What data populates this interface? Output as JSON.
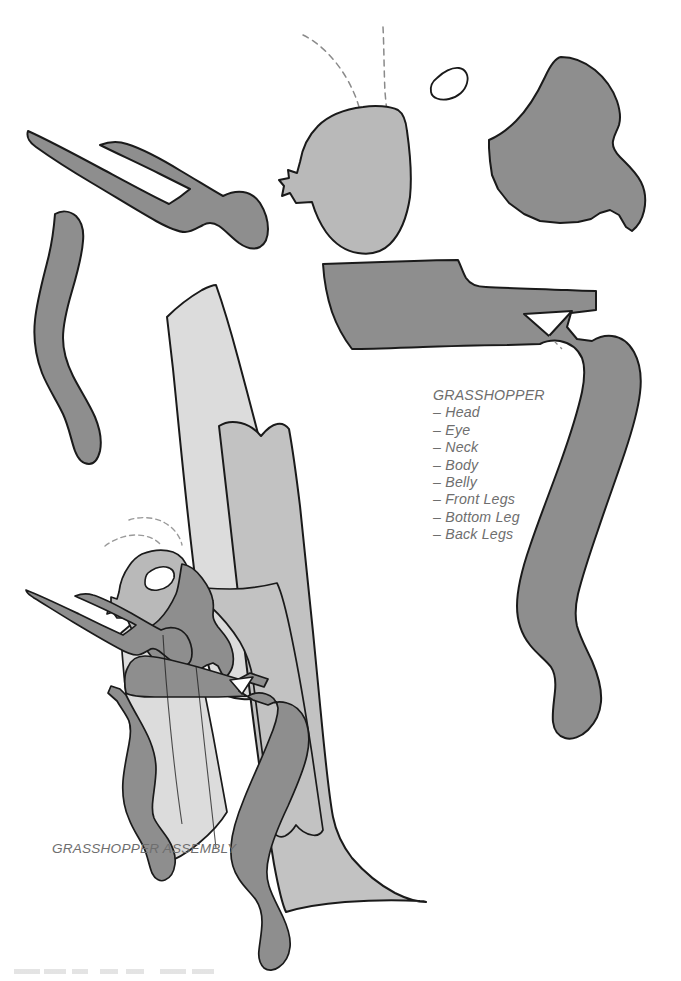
{
  "sheet": {
    "title": "Grasshopper paper cutout pattern sheet",
    "background_color": "#ffffff",
    "width": 681,
    "height": 981
  },
  "legend": {
    "title": "GRASSHOPPER",
    "items": [
      "– Head",
      "– Eye",
      "– Neck",
      "– Body",
      "– Belly",
      "– Front Legs",
      "– Bottom Leg",
      "– Back Legs"
    ]
  },
  "assembly": {
    "caption": "GRASSHOPPER ASSEMBLY"
  },
  "colors": {
    "outline": "#1a1a1a",
    "dark_gray": "#8e8e8e",
    "mid_gray": "#b9b9b9",
    "light_gray": "#dcdcdc",
    "belly_gray": "#c2c2c2",
    "eye_white": "#ffffff",
    "text_gray": "#6e6e6e",
    "dashed_gray": "#8a8a8a"
  },
  "pieces": [
    {
      "id": "head",
      "name": "Head",
      "fill": "#b9b9b9",
      "group": "cutouts"
    },
    {
      "id": "eye",
      "name": "Eye",
      "fill": "#ffffff",
      "group": "cutouts"
    },
    {
      "id": "neck",
      "name": "Neck",
      "fill": "#8e8e8e",
      "group": "cutouts"
    },
    {
      "id": "body",
      "name": "Body",
      "fill": "#dcdcdc",
      "group": "cutouts"
    },
    {
      "id": "belly",
      "name": "Belly",
      "fill": "#c2c2c2",
      "group": "cutouts"
    },
    {
      "id": "front-legs",
      "name": "Front Legs",
      "fill": "#8e8e8e",
      "group": "cutouts"
    },
    {
      "id": "bottom-leg",
      "name": "Bottom Leg",
      "fill": "#8e8e8e",
      "group": "cutouts"
    },
    {
      "id": "back-legs",
      "name": "Back Legs",
      "fill": "#8e8e8e",
      "group": "cutouts"
    }
  ],
  "antennae": {
    "count": 2,
    "style": "dashed"
  }
}
